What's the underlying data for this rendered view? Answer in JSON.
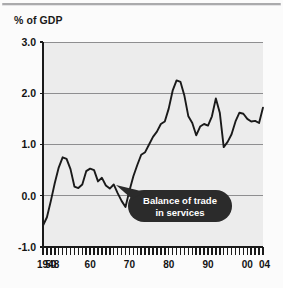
{
  "figure": {
    "axis_title": "% of GDP",
    "background_color": "#fbfbfb",
    "plot_background_color": "#ececec",
    "line_color": "#1a1a1a",
    "gridline_color": "#8e8e90",
    "callout_bg_color": "#2b2b2b",
    "callout_text_color": "#ffffff"
  },
  "callout": {
    "line1": "Balance of trade",
    "line2": "in services"
  },
  "chart_data": {
    "type": "line",
    "title": "",
    "subtitle": "",
    "xlabel": "",
    "ylabel": "% of GDP",
    "ylim": [
      -1.0,
      3.0
    ],
    "xlim": [
      1948,
      2004
    ],
    "yticks": [
      "3.0",
      "2.0",
      "1.0",
      "0.0",
      "-1.0"
    ],
    "ytick_values": [
      3.0,
      2.0,
      1.0,
      0.0,
      -1.0
    ],
    "xticks": [
      "1948",
      "50",
      "60",
      "70",
      "80",
      "90",
      "00",
      "04"
    ],
    "xtick_values": [
      1948,
      1950,
      1960,
      1970,
      1980,
      1990,
      2000,
      2004
    ],
    "grid": true,
    "grid_axis": "y",
    "legend": false,
    "minor_tick_interval_years": 1,
    "annotations": [
      {
        "text": "Balance of trade in services",
        "points_to_year": 1966,
        "points_to_value": -0.1
      }
    ],
    "series": [
      {
        "name": "Balance of trade in services",
        "x": [
          1948,
          1949,
          1950,
          1951,
          1952,
          1953,
          1954,
          1955,
          1956,
          1957,
          1958,
          1959,
          1960,
          1961,
          1962,
          1963,
          1964,
          1965,
          1966,
          1967,
          1968,
          1969,
          1970,
          1971,
          1972,
          1973,
          1974,
          1975,
          1976,
          1977,
          1978,
          1979,
          1980,
          1981,
          1982,
          1983,
          1984,
          1985,
          1986,
          1987,
          1988,
          1989,
          1990,
          1991,
          1992,
          1993,
          1994,
          1995,
          1996,
          1997,
          1998,
          1999,
          2000,
          2001,
          2002,
          2003,
          2004
        ],
        "values": [
          -0.58,
          -0.42,
          -0.1,
          0.25,
          0.55,
          0.75,
          0.72,
          0.52,
          0.18,
          0.15,
          0.22,
          0.48,
          0.53,
          0.5,
          0.28,
          0.35,
          0.2,
          0.14,
          0.22,
          0.05,
          -0.1,
          -0.22,
          0.1,
          0.38,
          0.6,
          0.8,
          0.85,
          1.0,
          1.15,
          1.25,
          1.4,
          1.45,
          1.7,
          2.05,
          2.25,
          2.22,
          1.95,
          1.55,
          1.42,
          1.18,
          1.35,
          1.4,
          1.37,
          1.55,
          1.9,
          1.62,
          1.6,
          1.2,
          0.95,
          0.78,
          0.75,
          0.8,
          0.75,
          0.95,
          0.98,
          1.05,
          1.15
        ]
      },
      {
        "name": "Balance of trade in services (continued)",
        "x": [
          1994,
          1995,
          1996,
          1997,
          1998,
          1999,
          2000,
          2001,
          2002,
          2003,
          2004
        ],
        "values": [
          0.95,
          1.05,
          1.2,
          1.45,
          1.62,
          1.6,
          1.5,
          1.45,
          1.46,
          1.42,
          1.72
        ]
      }
    ]
  }
}
